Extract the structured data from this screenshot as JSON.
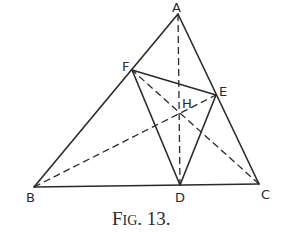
{
  "figure": {
    "caption_big_F": "F",
    "caption_small": "IG",
    "caption_rest": ". 13.",
    "caption": "FIG. 13."
  },
  "points": {
    "A": {
      "label": "A",
      "x": 178,
      "y": 14
    },
    "B": {
      "label": "B",
      "x": 34,
      "y": 187
    },
    "C": {
      "label": "C",
      "x": 259,
      "y": 184
    },
    "D": {
      "label": "D",
      "x": 180,
      "y": 185
    },
    "E": {
      "label": "E",
      "x": 216,
      "y": 95
    },
    "F": {
      "label": "F",
      "x": 132,
      "y": 70
    },
    "H": {
      "label": "H",
      "x": 180,
      "y": 113
    }
  },
  "segments": {
    "solid": [
      "AB",
      "AC",
      "BC",
      "FE",
      "FD",
      "ED"
    ],
    "dashed": [
      "AD",
      "BE",
      "CF"
    ]
  }
}
